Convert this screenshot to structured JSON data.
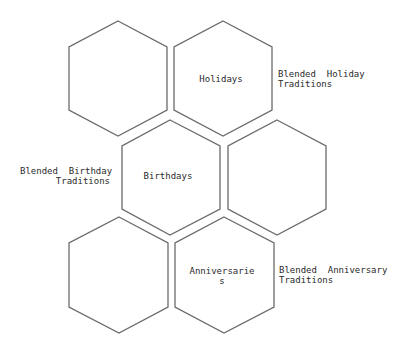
{
  "diagram": {
    "type": "hexagon-grid",
    "stroke_color": "#6b6b6b",
    "text_color": "#2a2a2a",
    "background": "#ffffff",
    "hexagons": [
      {
        "id": "hex-top-left",
        "label": "",
        "cx": 118,
        "cy": 78
      },
      {
        "id": "hex-holidays",
        "label": "Holidays",
        "cx": 223,
        "cy": 78
      },
      {
        "id": "hex-birthdays",
        "label": "Birthdays",
        "cx": 170,
        "cy": 177
      },
      {
        "id": "hex-middle-right",
        "label": "",
        "cx": 277,
        "cy": 177
      },
      {
        "id": "hex-bottom-left",
        "label": "",
        "cx": 118,
        "cy": 276
      },
      {
        "id": "hex-anniversaries",
        "label": "Anniversarie\ns",
        "cx": 223,
        "cy": 276
      }
    ],
    "annotations": {
      "holiday": "Blended  Holiday\nTraditions",
      "birthday": "Blended  Birthday\nTraditions",
      "anniversary": "Blended  Anniversary\nTraditions"
    }
  }
}
